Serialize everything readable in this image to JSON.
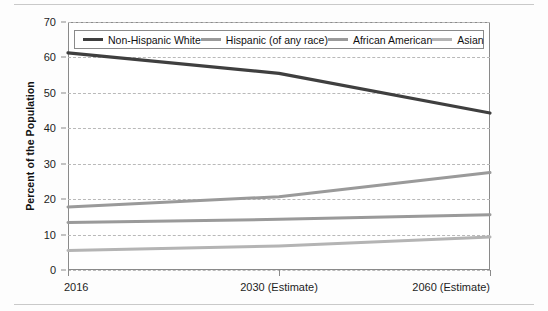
{
  "chart_data": {
    "type": "line",
    "title": "",
    "xlabel": "",
    "ylabel": "Percent of the Population",
    "x": [
      "2016",
      "2030 (Estimate)",
      "2060 (Estimate)"
    ],
    "xtick_labels": [
      "2016",
      "2030 (Estimate)",
      "2060 (Estimate)"
    ],
    "ytick_labels": [
      "0",
      "10",
      "20",
      "30",
      "40",
      "50",
      "60",
      "70"
    ],
    "ytick_values": [
      0,
      10,
      20,
      30,
      40,
      50,
      60,
      70
    ],
    "ylim": [
      0,
      70
    ],
    "grid": "horizontal-dashed",
    "legend_position": "top-inside",
    "series": [
      {
        "name": "Non-Hispanic White",
        "color": "#3f3f3f",
        "values": [
          61.3,
          55.5,
          44.3
        ]
      },
      {
        "name": "Hispanic (of any race)",
        "color": "#9a9a9a",
        "values": [
          17.8,
          20.7,
          27.5
        ]
      },
      {
        "name": "African American",
        "color": "#9a9a9a",
        "values": [
          13.4,
          14.3,
          15.6
        ]
      },
      {
        "name": "Asian",
        "color": "#b4b4b4",
        "values": [
          5.5,
          6.8,
          9.3
        ]
      }
    ]
  },
  "axis": {
    "y_title": "Percent of the Population"
  },
  "legend": {
    "items": [
      {
        "label": "Non-Hispanic White",
        "color": "#3f3f3f"
      },
      {
        "label": "Hispanic (of any race)",
        "color": "#9a9a9a"
      },
      {
        "label": "African American",
        "color": "#9a9a9a"
      },
      {
        "label": "Asian",
        "color": "#b4b4b4"
      }
    ]
  }
}
